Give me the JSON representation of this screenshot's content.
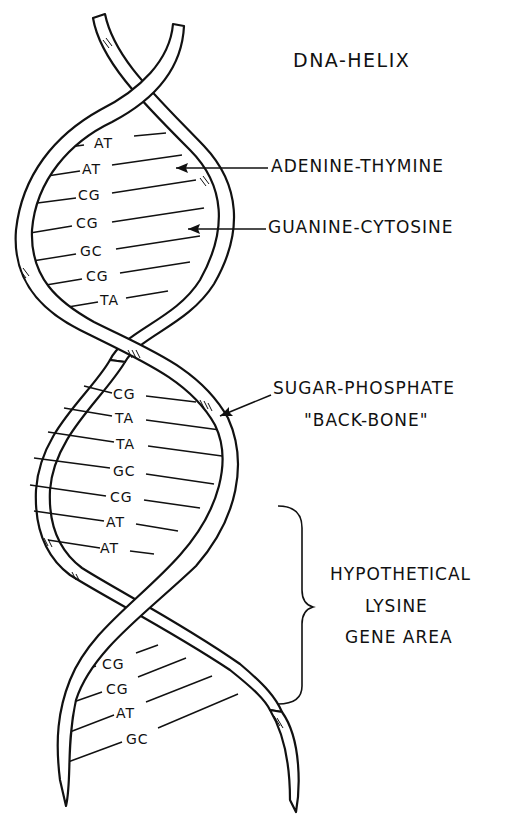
{
  "diagram": {
    "title": "DNA-HELIX",
    "labels": {
      "adenine_thymine": "ADENINE-THYMINE",
      "guanine_cytosine": "GUANINE-CYTOSINE",
      "backbone_line1": "SUGAR-PHOSPHATE",
      "backbone_line2": "\"BACK-BONE\"",
      "gene_area_line1": "HYPOTHETICAL",
      "gene_area_line2": "LYSINE",
      "gene_area_line3": "GENE AREA"
    },
    "base_pairs": {
      "upper_loop": [
        "AT",
        "AT",
        "CG",
        "CG",
        "GC",
        "CG",
        "TA"
      ],
      "middle_loop": [
        "CG",
        "TA",
        "TA",
        "GC",
        "CG",
        "AT",
        "AT"
      ],
      "lower_loop": [
        "CG",
        "CG",
        "AT",
        "GC"
      ]
    },
    "colors": {
      "ink": "#111111",
      "background": "#ffffff"
    }
  }
}
